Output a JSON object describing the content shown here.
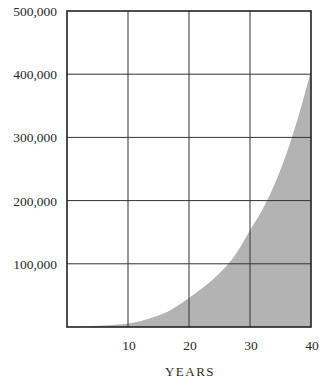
{
  "chart_data": {
    "type": "area",
    "title": "",
    "xlabel": "YEARS",
    "ylabel": "",
    "xlim": [
      0,
      40
    ],
    "ylim": [
      0,
      500000
    ],
    "grid": true,
    "legend": null,
    "x_ticks": [
      10,
      20,
      30,
      40
    ],
    "x_tick_labels": [
      "10",
      "20",
      "30",
      "40"
    ],
    "y_ticks": [
      100000,
      200000,
      300000,
      400000,
      500000
    ],
    "y_tick_labels": [
      "100,000",
      "200,000",
      "300,000",
      "400,000",
      "500,000"
    ],
    "series": [
      {
        "name": "Growth",
        "color": "#b3b3b3",
        "x": [
          0,
          2,
          4,
          6,
          8,
          10,
          12,
          14,
          16,
          18,
          20,
          22,
          24,
          26,
          28,
          30,
          32,
          34,
          36,
          38,
          40
        ],
        "values": [
          0,
          500,
          1200,
          2200,
          3500,
          5500,
          9000,
          15000,
          22000,
          33000,
          46000,
          60000,
          76000,
          95000,
          120000,
          153000,
          185000,
          225000,
          275000,
          335000,
          405000
        ]
      }
    ]
  },
  "colors": {
    "fill": "#b3b3b3",
    "grid": "#333333",
    "axis": "#222222",
    "text": "#2a2a2a"
  }
}
